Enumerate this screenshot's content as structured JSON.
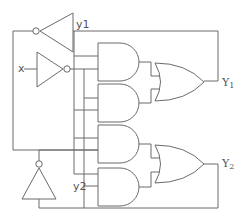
{
  "diagram": {
    "type": "logic-circuit",
    "labels": {
      "input_x": "x",
      "state_y1": "y1",
      "state_y2": "y2",
      "output_Y1": "Y",
      "output_Y1_sub": "1",
      "output_Y2": "Y",
      "output_Y2_sub": "2"
    },
    "components": {
      "inverters": 3,
      "and_gates": 4,
      "or_gates": 2
    },
    "line_color": "#6b6b6b",
    "background": "#ffffff"
  }
}
